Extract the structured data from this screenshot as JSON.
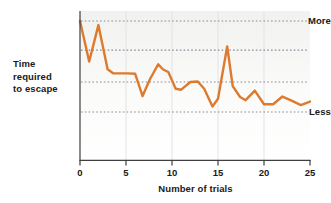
{
  "chart_data": {
    "type": "line",
    "title": "",
    "xlabel": "Number of trials",
    "ylabel": "Time required to escape",
    "ylabel_lines": [
      "Time",
      "required",
      "to escape"
    ],
    "xlim": [
      0,
      25
    ],
    "xticks": [
      0,
      5,
      10,
      15,
      20,
      25
    ],
    "xtick_labels": [
      "0",
      "5",
      "10",
      "15",
      "20",
      "25"
    ],
    "ylim": [
      0,
      1
    ],
    "ytick_labels": [
      "More",
      "Less"
    ],
    "ytick_values": [
      1,
      0
    ],
    "y_axis_note": "Unlabeled qualitative scale; 'More' at top, 'Less' near bottom",
    "grid": {
      "horizontal": true,
      "horizontal_style": "dotted",
      "horizontal_values": [
        1.0,
        0.68,
        0.33,
        0.0
      ],
      "vertical": true,
      "vertical_style": "solid-faint",
      "vertical_values": [
        5,
        10,
        15,
        20
      ]
    },
    "legend": null,
    "series": [
      {
        "name": "Time required to escape",
        "color": "#DD7A2E",
        "line_width": 2.4,
        "markers": false,
        "x": [
          0,
          1,
          2,
          3,
          3.6,
          4.5,
          5.2,
          6,
          6.8,
          7.6,
          8.5,
          9,
          9.6,
          10.4,
          11,
          12,
          12.8,
          13.5,
          14.4,
          15,
          16,
          16.6,
          17.4,
          18,
          19,
          20,
          21,
          22,
          23,
          24,
          25
        ],
        "y": [
          1.0,
          0.555,
          0.955,
          0.47,
          0.425,
          0.425,
          0.425,
          0.42,
          0.175,
          0.36,
          0.525,
          0.47,
          0.44,
          0.255,
          0.245,
          0.33,
          0.335,
          0.255,
          0.06,
          0.145,
          0.72,
          0.285,
          0.165,
          0.13,
          0.235,
          0.085,
          0.085,
          0.17,
          0.125,
          0.075,
          0.115
        ]
      }
    ]
  },
  "colors": {
    "line": "#DD7A2E",
    "plot_background_top": "#f3f3f1",
    "plot_background_bottom": "#ffffff",
    "axis": "#3f3f3f",
    "gridline_dotted": "#8a8a9a",
    "gridline_vertical": "#dfe3e8",
    "text": "#1a1a1a"
  }
}
